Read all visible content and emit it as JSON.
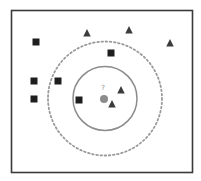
{
  "diagram": {
    "title": "",
    "query_point": {
      "label": "?",
      "color": "#8c8c8c",
      "x": 104,
      "y": 99
    },
    "neighborhoods": [
      {
        "name": "inner-radius",
        "style": "solid",
        "color": "#8c8c8c",
        "radius": 32
      },
      {
        "name": "outer-radius",
        "style": "dashed",
        "color": "#9a9a9a",
        "radius": 57
      }
    ],
    "class_colors": {
      "square": "#1e1e1e",
      "triangle": "#3c3c3c"
    },
    "points": [
      {
        "cls": "square",
        "x": 36,
        "y": 42
      },
      {
        "cls": "square",
        "x": 34,
        "y": 81
      },
      {
        "cls": "square",
        "x": 58,
        "y": 81
      },
      {
        "cls": "square",
        "x": 34,
        "y": 99
      },
      {
        "cls": "square",
        "x": 79,
        "y": 100
      },
      {
        "cls": "square",
        "x": 111,
        "y": 53
      },
      {
        "cls": "triangle",
        "x": 87,
        "y": 33
      },
      {
        "cls": "triangle",
        "x": 129,
        "y": 30
      },
      {
        "cls": "triangle",
        "x": 170,
        "y": 43
      },
      {
        "cls": "triangle",
        "x": 121,
        "y": 90
      },
      {
        "cls": "triangle",
        "x": 112,
        "y": 104
      }
    ]
  }
}
